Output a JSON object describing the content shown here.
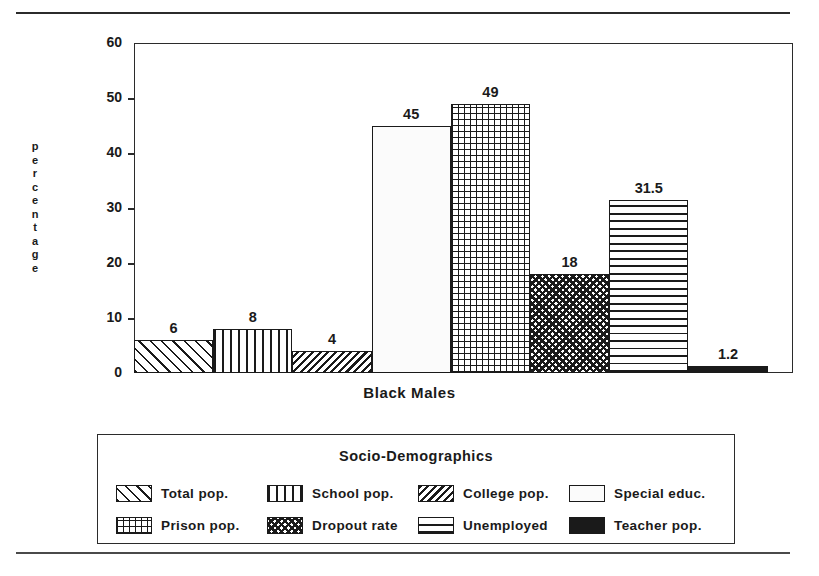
{
  "chart_data": {
    "type": "bar",
    "title": "",
    "xlabel": "Black Males",
    "ylabel": "percentage",
    "ylim": [
      0,
      60
    ],
    "ytick_labels": [
      "60",
      "50",
      "40",
      "30",
      "20",
      "10",
      "0"
    ],
    "ytick_values": [
      60,
      50,
      40,
      30,
      20,
      10,
      0
    ],
    "grid": false,
    "legend_position": "below-plot",
    "legend_title": "Socio-Demographics",
    "categories": [
      "Total pop.",
      "School pop.",
      "College pop.",
      "Special educ.",
      "Prison pop.",
      "Dropout rate",
      "Unemployed",
      "Teacher pop."
    ],
    "values": [
      6,
      8,
      4,
      45,
      49,
      18,
      31.5,
      1.2
    ],
    "value_labels": [
      "6",
      "8",
      "4",
      "45",
      "49",
      "18",
      "31.5",
      "1.2"
    ],
    "patterns": [
      "diagonal-forward-hatch",
      "vertical-lines",
      "dense-backslash-hatch",
      "blank-white",
      "grid-crosshatch",
      "checkered",
      "horizontal-lines",
      "solid-black"
    ],
    "bar_color": "#1a1a1a",
    "background_color": "#ffffff"
  },
  "axes": {
    "y_title_letters": [
      "p",
      "e",
      "r",
      "c",
      "e",
      "n",
      "t",
      "a",
      "g",
      "e"
    ],
    "y_title": "percentage",
    "x_label": "Black Males",
    "ticks": [
      {
        "label": "60",
        "value": 60
      },
      {
        "label": "50",
        "value": 50
      },
      {
        "label": "40",
        "value": 40
      },
      {
        "label": "30",
        "value": 30
      },
      {
        "label": "20",
        "value": 20
      },
      {
        "label": "10",
        "value": 10
      },
      {
        "label": "0",
        "value": 0
      }
    ]
  },
  "bars": [
    {
      "label": "Total pop.",
      "value": 6,
      "value_label": "6",
      "pattern": "diagonal-forward-hatch"
    },
    {
      "label": "School pop.",
      "value": 8,
      "value_label": "8",
      "pattern": "vertical-lines"
    },
    {
      "label": "College pop.",
      "value": 4,
      "value_label": "4",
      "pattern": "dense-backslash-hatch"
    },
    {
      "label": "Special educ.",
      "value": 45,
      "value_label": "45",
      "pattern": "blank-white"
    },
    {
      "label": "Prison pop.",
      "value": 49,
      "value_label": "49",
      "pattern": "grid-crosshatch"
    },
    {
      "label": "Dropout rate",
      "value": 18,
      "value_label": "18",
      "pattern": "checkered"
    },
    {
      "label": "Unemployed",
      "value": 31.5,
      "value_label": "31.5",
      "pattern": "horizontal-lines"
    },
    {
      "label": "Teacher pop.",
      "value": 1.2,
      "value_label": "1.2",
      "pattern": "solid-black"
    }
  ],
  "legend": {
    "title": "Socio-Demographics",
    "rows": [
      [
        {
          "label": "Total pop.",
          "pattern": "diagonal-forward-hatch"
        },
        {
          "label": "School pop.",
          "pattern": "vertical-lines"
        },
        {
          "label": "College pop.",
          "pattern": "dense-backslash-hatch"
        },
        {
          "label": "Special educ.",
          "pattern": "blank-white"
        }
      ],
      [
        {
          "label": "Prison pop.",
          "pattern": "grid-crosshatch"
        },
        {
          "label": "Dropout rate",
          "pattern": "checkered"
        },
        {
          "label": "Unemployed",
          "pattern": "horizontal-lines"
        },
        {
          "label": "Teacher pop.",
          "pattern": "solid-black"
        }
      ]
    ]
  }
}
